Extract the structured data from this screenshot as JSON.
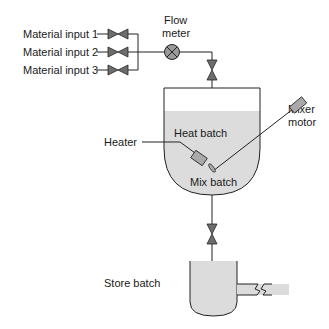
{
  "diagram": {
    "labels": {
      "input1": "Material input 1",
      "input2": "Material input 2",
      "input3": "Material input 3",
      "flow_meter_line1": "Flow",
      "flow_meter_line2": "meter",
      "mixer_motor_line1": "Mixer",
      "mixer_motor_line2": "motor",
      "heater": "Heater",
      "heat_batch": "Heat batch",
      "mix_batch": "Mix batch",
      "store_batch": "Store batch"
    },
    "colors": {
      "liquid": "#dcdcdc",
      "valve": "#6d6d6d",
      "line": "#222222"
    }
  }
}
